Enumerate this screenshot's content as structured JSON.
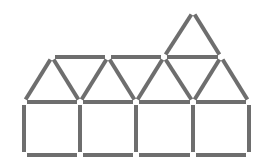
{
  "diagram": {
    "type": "matchstick-puzzle",
    "colors": {
      "background": "#ffffff",
      "match": "#6e6e6e",
      "match_edge": "#555555"
    },
    "match_thickness": 4,
    "gap": 3,
    "vertices": {
      "bottom_y": 155,
      "mid_y": 102,
      "upper_y": 57,
      "top_y": 12,
      "base_x": [
        24,
        80,
        136,
        193,
        249
      ],
      "apex_x": [
        52,
        108,
        164,
        221
      ],
      "top_apex_x": 193
    },
    "matches": [
      {
        "id": "bottom-1",
        "x1": 24,
        "y1": 155,
        "x2": 80,
        "y2": 155
      },
      {
        "id": "bottom-2",
        "x1": 80,
        "y1": 155,
        "x2": 136,
        "y2": 155
      },
      {
        "id": "bottom-3",
        "x1": 136,
        "y1": 155,
        "x2": 193,
        "y2": 155
      },
      {
        "id": "bottom-4",
        "x1": 193,
        "y1": 155,
        "x2": 249,
        "y2": 155
      },
      {
        "id": "vertical-1",
        "x1": 24,
        "y1": 102,
        "x2": 24,
        "y2": 155
      },
      {
        "id": "vertical-2",
        "x1": 80,
        "y1": 102,
        "x2": 80,
        "y2": 155
      },
      {
        "id": "vertical-3",
        "x1": 136,
        "y1": 102,
        "x2": 136,
        "y2": 155
      },
      {
        "id": "vertical-4",
        "x1": 193,
        "y1": 102,
        "x2": 193,
        "y2": 155
      },
      {
        "id": "vertical-5",
        "x1": 249,
        "y1": 102,
        "x2": 249,
        "y2": 155
      },
      {
        "id": "mid-1",
        "x1": 24,
        "y1": 102,
        "x2": 80,
        "y2": 102
      },
      {
        "id": "mid-2",
        "x1": 80,
        "y1": 102,
        "x2": 136,
        "y2": 102
      },
      {
        "id": "mid-3",
        "x1": 136,
        "y1": 102,
        "x2": 193,
        "y2": 102
      },
      {
        "id": "mid-4",
        "x1": 193,
        "y1": 102,
        "x2": 249,
        "y2": 102
      },
      {
        "id": "diag-1",
        "x1": 24,
        "y1": 102,
        "x2": 52,
        "y2": 57
      },
      {
        "id": "diag-2",
        "x1": 52,
        "y1": 57,
        "x2": 80,
        "y2": 102
      },
      {
        "id": "diag-3",
        "x1": 80,
        "y1": 102,
        "x2": 108,
        "y2": 57
      },
      {
        "id": "diag-4",
        "x1": 108,
        "y1": 57,
        "x2": 136,
        "y2": 102
      },
      {
        "id": "diag-5",
        "x1": 136,
        "y1": 102,
        "x2": 164,
        "y2": 57
      },
      {
        "id": "diag-6",
        "x1": 164,
        "y1": 57,
        "x2": 193,
        "y2": 102
      },
      {
        "id": "diag-7",
        "x1": 193,
        "y1": 102,
        "x2": 221,
        "y2": 57
      },
      {
        "id": "diag-8",
        "x1": 221,
        "y1": 57,
        "x2": 249,
        "y2": 102
      },
      {
        "id": "upper-1",
        "x1": 52,
        "y1": 57,
        "x2": 108,
        "y2": 57
      },
      {
        "id": "upper-2",
        "x1": 108,
        "y1": 57,
        "x2": 164,
        "y2": 57
      },
      {
        "id": "upper-3",
        "x1": 164,
        "y1": 57,
        "x2": 221,
        "y2": 57
      },
      {
        "id": "top-left",
        "x1": 164,
        "y1": 57,
        "x2": 193,
        "y2": 12
      },
      {
        "id": "top-right",
        "x1": 193,
        "y1": 12,
        "x2": 221,
        "y2": 57
      }
    ]
  }
}
